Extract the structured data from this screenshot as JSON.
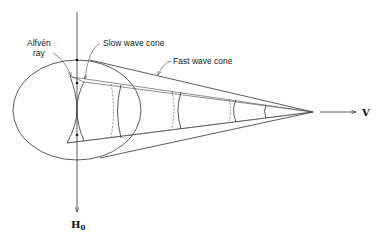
{
  "diagram": {
    "labels": {
      "alfven_line1": "Alfvén",
      "alfven_line2": "ray",
      "slow_wave": "Slow wave cone",
      "fast_wave": "Fast wave cone",
      "velocity": "V",
      "field": "H",
      "field_sub": "0"
    },
    "colors": {
      "line": "#333333",
      "background": "#ffffff"
    }
  }
}
